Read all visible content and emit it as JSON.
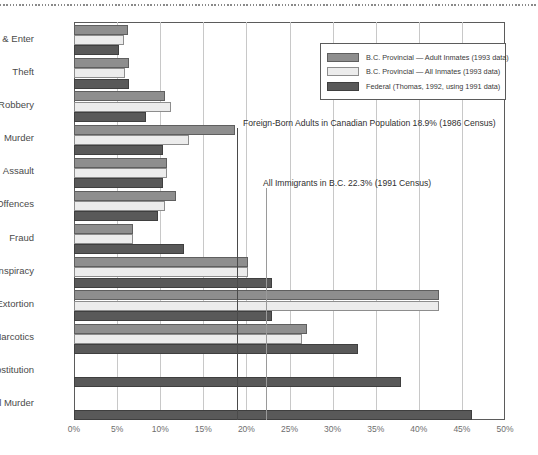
{
  "chart_data": {
    "type": "bar",
    "orientation": "horizontal",
    "title": "",
    "xlabel": "",
    "ylabel": "",
    "xlim": [
      0,
      50
    ],
    "xticks": [
      "0%",
      "5%",
      "10%",
      "15%",
      "20%",
      "25%",
      "30%",
      "35%",
      "40%",
      "45%",
      "50%"
    ],
    "grid": true,
    "legend_position": "top-right",
    "categories": [
      "Break & Enter",
      "Theft",
      "Robbery",
      "Murder",
      "Assault",
      "Sex Offences",
      "Fraud",
      "Conspiracy",
      "Extortion",
      "Narcotics",
      "Prostitution",
      "Counsel Murder"
    ],
    "series": [
      {
        "name": "B.C. Provincial — Adult Inmates (1993 data)",
        "color": "#8e8e8e",
        "values": [
          6.3,
          6.4,
          10.5,
          18.7,
          10.8,
          11.8,
          6.8,
          20.2,
          42.3,
          27.0,
          null,
          null
        ]
      },
      {
        "name": "B.C. Provincial — All Inmates (1993 data)",
        "color": "#ececec",
        "values": [
          5.8,
          5.9,
          11.2,
          13.3,
          10.8,
          10.5,
          6.8,
          20.2,
          42.3,
          26.5,
          null,
          null
        ]
      },
      {
        "name": "Federal (Thomas, 1992, using 1991 data)",
        "color": "#595959",
        "values": [
          5.2,
          6.4,
          8.3,
          10.3,
          10.3,
          9.8,
          12.8,
          23.0,
          23.0,
          33.0,
          37.9,
          46.2
        ]
      }
    ],
    "annotations": [
      {
        "id": "foreign-born-line",
        "label": "Foreign-Born Adults in Canadian Population 18.9% (1986 Census)",
        "value": 18.9,
        "color": "#4a4a4a"
      },
      {
        "id": "all-immigrants-line",
        "label": "All Immigrants in B.C. 22.3% (1991 Census)",
        "value": 22.3,
        "color": "#9a9a9a"
      }
    ]
  }
}
